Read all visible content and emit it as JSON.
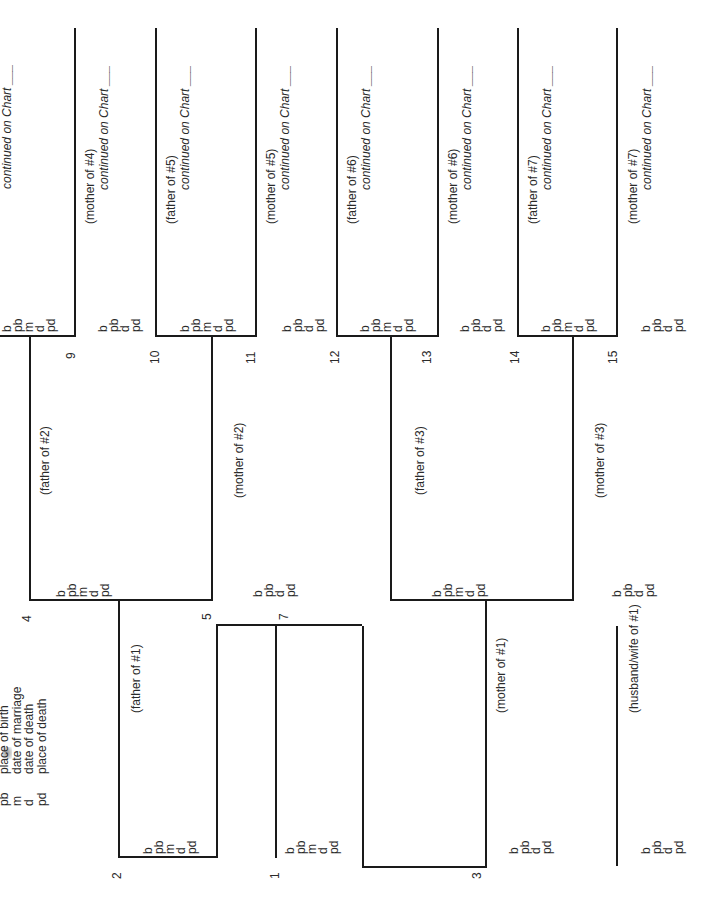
{
  "legend": [
    {
      "abbr": "pb",
      "meaning": "place of birth"
    },
    {
      "abbr": "m",
      "meaning": "date of marriage"
    },
    {
      "abbr": "d",
      "meaning": "date of death"
    },
    {
      "abbr": "pd",
      "meaning": "place of death"
    }
  ],
  "fields_married": [
    "b",
    "pb",
    "m",
    "d",
    "pd"
  ],
  "fields_unmarried": [
    "b",
    "pb",
    "d",
    "pd"
  ],
  "continued_label": "continued on Chart ___",
  "persons": {
    "p1": {
      "num": "1",
      "role": ""
    },
    "p2": {
      "num": "2",
      "role": "(father of #1)"
    },
    "p3": {
      "num": "3",
      "role": "(mother of #1)"
    },
    "p4": {
      "num": "4",
      "role": "(father of #2)"
    },
    "p5": {
      "num": "5",
      "role": "(mother of #2)"
    },
    "p6": {
      "num": "6",
      "role": "(father of #3)"
    },
    "p7": {
      "num": "7",
      "role": "(mother of #3)"
    },
    "p8": {
      "num": "8",
      "role": "(father of #4)"
    },
    "p9": {
      "num": "9",
      "role": "(mother of #4)"
    },
    "p10": {
      "num": "10",
      "role": "(father of #5)"
    },
    "p11": {
      "num": "11",
      "role": "(mother of #5)"
    },
    "p12": {
      "num": "12",
      "role": "(father of #6)"
    },
    "p13": {
      "num": "13",
      "role": "(mother of #6)"
    },
    "p14": {
      "num": "14",
      "role": "(father of #7)"
    },
    "p15": {
      "num": "15",
      "role": "(mother of #7)"
    },
    "spouse": {
      "num": "",
      "role": "(husband/wife of #1)"
    }
  },
  "visible_numbers": {
    "n1": "1",
    "n2": "2",
    "n3": "3",
    "n4": "4",
    "n5": "5",
    "n7": "7",
    "n9": "9",
    "n10": "10",
    "n11": "11",
    "n12": "12",
    "n13": "13",
    "n14": "14",
    "n15": "15"
  }
}
